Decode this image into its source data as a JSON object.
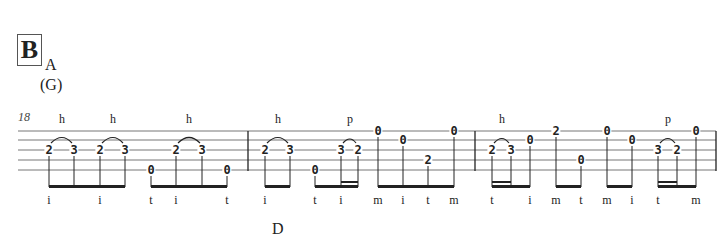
{
  "section": "B",
  "chords": [
    {
      "label": "A",
      "x": 45,
      "y": 72
    },
    {
      "label": "(G)",
      "x": 40,
      "y": 92
    },
    {
      "label": "D",
      "x": 272,
      "y": 236
    }
  ],
  "measure_number": "18",
  "techniques": [
    {
      "label": "h",
      "x": 62
    },
    {
      "label": "h",
      "x": 113
    },
    {
      "label": "h",
      "x": 189
    },
    {
      "label": "h",
      "x": 278
    },
    {
      "label": "p",
      "x": 350
    },
    {
      "label": "h",
      "x": 502
    },
    {
      "label": "p",
      "x": 668
    }
  ],
  "notes": [
    {
      "fret": "2",
      "x": 49,
      "string": 3
    },
    {
      "fret": "3",
      "x": 74,
      "string": 3
    },
    {
      "fret": "2",
      "x": 100,
      "string": 3
    },
    {
      "fret": "3",
      "x": 125,
      "string": 3
    },
    {
      "fret": "0",
      "x": 151,
      "string": 5
    },
    {
      "fret": "2",
      "x": 176,
      "string": 3
    },
    {
      "fret": "3",
      "x": 202,
      "string": 3
    },
    {
      "fret": "0",
      "x": 227,
      "string": 5
    },
    {
      "fret": "2",
      "x": 265,
      "string": 3
    },
    {
      "fret": "3",
      "x": 290,
      "string": 3
    },
    {
      "fret": "0",
      "x": 315,
      "string": 5
    },
    {
      "fret": "3",
      "x": 341,
      "string": 3
    },
    {
      "fret": "2",
      "x": 358,
      "string": 3
    },
    {
      "fret": "0",
      "x": 378,
      "string": 1
    },
    {
      "fret": "0",
      "x": 403,
      "string": 2
    },
    {
      "fret": "2",
      "x": 428,
      "string": 4
    },
    {
      "fret": "0",
      "x": 454,
      "string": 1
    },
    {
      "fret": "2",
      "x": 492,
      "string": 3
    },
    {
      "fret": "3",
      "x": 511,
      "string": 3
    },
    {
      "fret": "0",
      "x": 530,
      "string": 2
    },
    {
      "fret": "2",
      "x": 556,
      "string": 1
    },
    {
      "fret": "0",
      "x": 581,
      "string": 4
    },
    {
      "fret": "0",
      "x": 607,
      "string": 1
    },
    {
      "fret": "0",
      "x": 632,
      "string": 2
    },
    {
      "fret": "3",
      "x": 658,
      "string": 3
    },
    {
      "fret": "2",
      "x": 677,
      "string": 3
    },
    {
      "fret": "0",
      "x": 696,
      "string": 1
    }
  ],
  "fingerings": [
    {
      "label": "i",
      "x": 49
    },
    {
      "label": "i",
      "x": 100
    },
    {
      "label": "t",
      "x": 151
    },
    {
      "label": "i",
      "x": 176
    },
    {
      "label": "t",
      "x": 227
    },
    {
      "label": "i",
      "x": 265
    },
    {
      "label": "t",
      "x": 315
    },
    {
      "label": "i",
      "x": 341
    },
    {
      "label": "m",
      "x": 378
    },
    {
      "label": "i",
      "x": 403
    },
    {
      "label": "t",
      "x": 428
    },
    {
      "label": "m",
      "x": 454
    },
    {
      "label": "t",
      "x": 492
    },
    {
      "label": "i",
      "x": 530
    },
    {
      "label": "m",
      "x": 556
    },
    {
      "label": "t",
      "x": 581
    },
    {
      "label": "m",
      "x": 607
    },
    {
      "label": "i",
      "x": 632
    },
    {
      "label": "t",
      "x": 658
    },
    {
      "label": "m",
      "x": 696
    }
  ]
}
